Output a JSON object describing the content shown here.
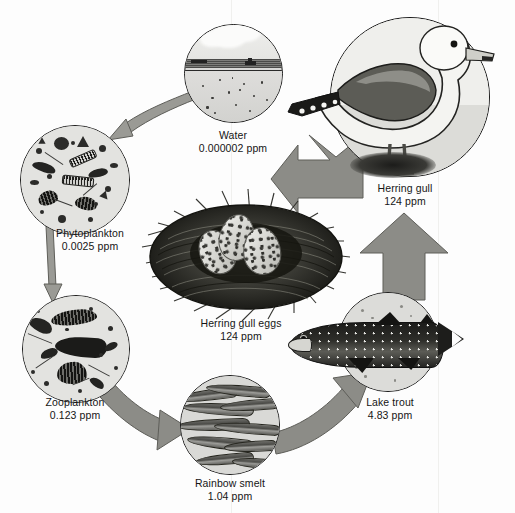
{
  "diagram": {
    "type": "food-chain-biomagnification",
    "unit": "ppm",
    "colors": {
      "arrow_fill": "#8c8c87",
      "arrow_stroke": "#5e5e59",
      "circle_fill": "#d8d8d6",
      "circle_stroke": "#1a1a1a",
      "background": "#ffffff",
      "text": "#151515"
    }
  },
  "nodes": [
    {
      "id": "water",
      "name": "Water",
      "value": "0.000002 ppm",
      "concentration_ppm": 2e-06,
      "trophic_level": 0,
      "icon": "lake-water-circle-icon"
    },
    {
      "id": "phytoplankton",
      "name": "Phytoplankton",
      "value": "0.0025 ppm",
      "concentration_ppm": 0.0025,
      "trophic_level": 1,
      "icon": "phytoplankton-circle-icon"
    },
    {
      "id": "zooplankton",
      "name": "Zooplankton",
      "value": "0.123 ppm",
      "concentration_ppm": 0.123,
      "trophic_level": 2,
      "icon": "zooplankton-circle-icon"
    },
    {
      "id": "rainbow-smelt",
      "name": "Rainbow smelt",
      "value": "1.04 ppm",
      "concentration_ppm": 1.04,
      "trophic_level": 3,
      "icon": "rainbow-smelt-circle-icon"
    },
    {
      "id": "lake-trout",
      "name": "Lake trout",
      "value": "4.83 ppm",
      "concentration_ppm": 4.83,
      "trophic_level": 4,
      "icon": "lake-trout-icon"
    },
    {
      "id": "herring-gull",
      "name": "Herring gull",
      "value": "124 ppm",
      "concentration_ppm": 124,
      "trophic_level": 5,
      "icon": "herring-gull-icon"
    },
    {
      "id": "herring-gull-eggs",
      "name": "Herring gull eggs",
      "value": "124 ppm",
      "concentration_ppm": 124,
      "trophic_level": 5,
      "icon": "herring-gull-eggs-nest-icon"
    }
  ],
  "arrows": [
    {
      "id": "water-to-phytoplankton",
      "from": "water",
      "to": "phytoplankton",
      "style": "thin-curved"
    },
    {
      "id": "phytoplankton-to-zooplankton",
      "from": "phytoplankton",
      "to": "zooplankton",
      "style": "thin-straight"
    },
    {
      "id": "zooplankton-to-smelt",
      "from": "zooplankton",
      "to": "rainbow-smelt",
      "style": "thick-curved"
    },
    {
      "id": "smelt-to-lake-trout",
      "from": "rainbow-smelt",
      "to": "lake-trout",
      "style": "thick-curved"
    },
    {
      "id": "lake-trout-to-herring-gull",
      "from": "lake-trout",
      "to": "herring-gull",
      "style": "thick-up"
    },
    {
      "id": "herring-gull-to-eggs",
      "from": "herring-gull",
      "to": "herring-gull-eggs",
      "style": "thick-left"
    }
  ]
}
